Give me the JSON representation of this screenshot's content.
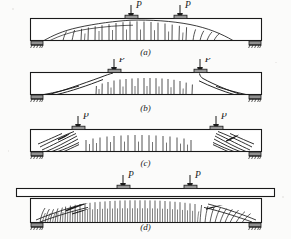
{
  "figure": {
    "type": "engineering-line-diagram",
    "ink_color": "#1a1a1a",
    "paper_color": "#fbfbfa"
  },
  "load_label": "P",
  "panels": [
    {
      "id": "a",
      "caption": "(a)",
      "beam_type": "rectangular",
      "crack_pattern": "flexural cracks with curved crack-envelope arc, vertical in midspan, inclined toward supports",
      "loads": [
        {
          "label": "P",
          "x_fraction": 0.45
        },
        {
          "label": "P",
          "x_fraction": 0.62
        }
      ],
      "supports": [
        "hatched-pin-left",
        "hatched-pin-right"
      ]
    },
    {
      "id": "b",
      "caption": "(b)",
      "beam_type": "rectangular",
      "crack_pattern": "flexural cracks in midspan plus long inclined diagonal tension cracks running from supports to load points",
      "loads": [
        {
          "label": "P",
          "x_fraction": 0.4
        },
        {
          "label": "P",
          "x_fraction": 0.72
        }
      ],
      "supports": [
        "hatched-pin-left",
        "hatched-pin-right"
      ]
    },
    {
      "id": "c",
      "caption": "(c)",
      "beam_type": "rectangular",
      "crack_pattern": "short vertical flexural cracks in midspan with dense steep shear cracks clustered at both shear spans",
      "loads": [
        {
          "label": "P",
          "x_fraction": 0.28
        },
        {
          "label": "P",
          "x_fraction": 0.8
        }
      ],
      "supports": [
        "hatched-pin-left",
        "hatched-pin-right"
      ]
    },
    {
      "id": "d",
      "caption": "(d)",
      "beam_type": "T-beam with top flange",
      "crack_pattern": "very dense vertical flexural cracks across full web, inclined and heavily blackened crushing zones near supports",
      "loads": [
        {
          "label": "P",
          "x_fraction": 0.42
        },
        {
          "label": "P",
          "x_fraction": 0.68
        }
      ],
      "supports": [
        "hatched-pin-left",
        "hatched-pin-right"
      ]
    }
  ]
}
